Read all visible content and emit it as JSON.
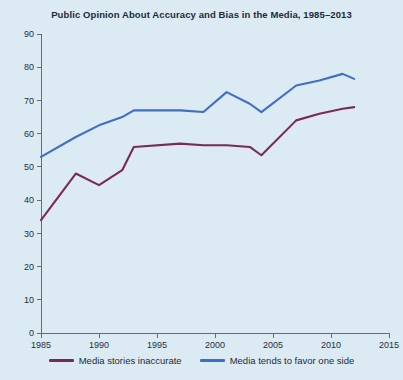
{
  "chart_data": {
    "type": "line",
    "title": "Public Opinion About Accuracy and Bias in the Media, 1985–2013",
    "xlabel": "",
    "ylabel": "",
    "xlim": [
      1985,
      2015
    ],
    "ylim": [
      0,
      90
    ],
    "xticks": [
      1985,
      1990,
      1995,
      2000,
      2005,
      2010,
      2015
    ],
    "xtick_labels": [
      "1985",
      "1990",
      "1995",
      "2000",
      "2005",
      "2010",
      "2015"
    ],
    "yticks": [
      0,
      10,
      20,
      30,
      40,
      50,
      60,
      70,
      80,
      90
    ],
    "ytick_labels": [
      "0",
      "10",
      "20",
      "30",
      "40",
      "50",
      "60",
      "70",
      "80",
      "90"
    ],
    "grid": false,
    "legend_position": "bottom-center",
    "series": [
      {
        "name": "Media stories inaccurate",
        "color": "#7b2a55",
        "x": [
          1985,
          1988,
          1990,
          1992,
          1993,
          1997,
          1999,
          2001,
          2003,
          2004,
          2007,
          2009,
          2011,
          2012
        ],
        "values": [
          34,
          48,
          44.5,
          49,
          56,
          57,
          56.5,
          56.5,
          56,
          53.5,
          64,
          66,
          67.5,
          68
        ]
      },
      {
        "name": "Media tends to favor one side",
        "color": "#3f6fc4",
        "x": [
          1985,
          1988,
          1990,
          1992,
          1993,
          1997,
          1999,
          2001,
          2003,
          2004,
          2007,
          2009,
          2011,
          2012
        ],
        "values": [
          53,
          59,
          62.5,
          65,
          67,
          67,
          66.5,
          72.5,
          69,
          66.5,
          74.5,
          76,
          78,
          76.5
        ]
      }
    ]
  },
  "legend": {
    "entries": [
      {
        "label": "Media stories inaccurate",
        "color": "#7b2a55"
      },
      {
        "label": "Media tends to favor one side",
        "color": "#3f6fc4"
      }
    ]
  },
  "colors": {
    "background": "#dceaf4",
    "axis": "#5a6f80",
    "text": "#1d2b38",
    "series_inaccurate": "#7b2a55",
    "series_favor_one_side": "#3f6fc4"
  }
}
